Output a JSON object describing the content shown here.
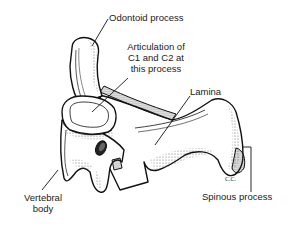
{
  "diagram": {
    "labels": {
      "odontoid": "Odontoid process",
      "articulation_l1": "Articulation of",
      "articulation_l2": "C1 and C2 at",
      "articulation_l3": "this process",
      "lamina": "Lamina",
      "vertebral_body_l1": "Vertebral",
      "vertebral_body_l2": "body",
      "spinous": "Spinous process"
    },
    "signature": "C.C.",
    "colors": {
      "ink": "#1a1a1a",
      "background": "#ffffff",
      "stipple": "#555555"
    }
  }
}
